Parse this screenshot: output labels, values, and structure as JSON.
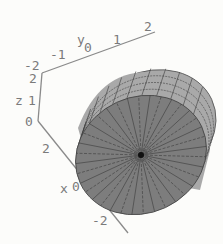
{
  "chart_data": {
    "type": "surface3d",
    "title": "",
    "axes": {
      "x": {
        "label": "x",
        "ticks": [
          "2",
          "0",
          "-2"
        ],
        "range": [
          -2,
          2
        ]
      },
      "y": {
        "label": "y",
        "ticks": [
          "-2",
          "-1",
          "0",
          "1",
          "2"
        ],
        "range": [
          -2,
          2
        ]
      },
      "z": {
        "label": "z",
        "ticks": [
          "0",
          "1",
          "2"
        ],
        "range": [
          0,
          2
        ]
      }
    },
    "surface": {
      "face_color": "#7d7d7d",
      "side_color": "#a9a9a9",
      "mesh_color": "#3a3a3a",
      "radial_mesh_lines": 36,
      "side_bands": 3
    }
  }
}
